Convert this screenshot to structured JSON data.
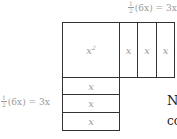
{
  "diagram": {
    "top_label": {
      "num": "1",
      "den": "2",
      "expr": "(6x) = 3x"
    },
    "left_label": {
      "num": "1",
      "den": "2",
      "expr": "(6x) = 3x"
    },
    "square": {
      "base": "x",
      "exp": "2"
    },
    "right_strips": [
      "x",
      "x",
      "x"
    ],
    "bottom_strips": [
      "x",
      "x",
      "x"
    ]
  },
  "partial_text": {
    "line1": "N",
    "line2": "co"
  }
}
